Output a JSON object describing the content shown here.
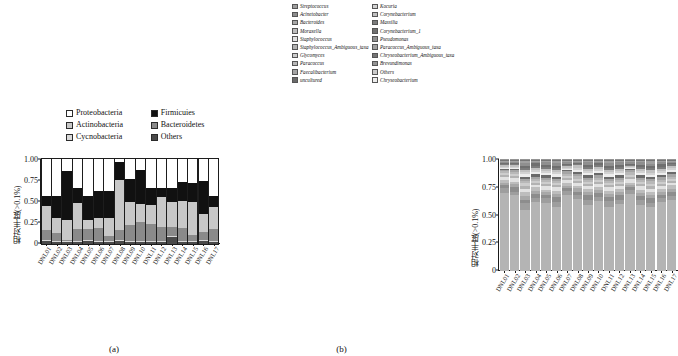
{
  "figure": {
    "panel_a_caption": "(a)",
    "panel_b_caption": "(b)"
  },
  "panel_a": {
    "ylabel": "相对丰度(>0.1%)",
    "legend": [
      {
        "label": "Proteobacteria",
        "color": "#ffffff"
      },
      {
        "label": "Firmicuies",
        "color": "#111111"
      },
      {
        "label": "Actinobacteria",
        "color": "#c8c8c8"
      },
      {
        "label": "Bacteroidetes",
        "color": "#8a8a8a"
      },
      {
        "label": "Cycnobacteria",
        "color": "#d9d9d9"
      },
      {
        "label": "Others",
        "color": "#4a4a4a"
      }
    ]
  },
  "panel_b": {
    "ylabel": "相对丰度(>0.1%)",
    "legend": [
      {
        "label": "Streptococcus",
        "color": "#9e9e9e"
      },
      {
        "label": "Kocuria",
        "color": "#d2d2d2"
      },
      {
        "label": "Acinetobacter",
        "color": "#8d8d8d"
      },
      {
        "label": "Corynebacterium",
        "color": "#c0c0c0"
      },
      {
        "label": "Bacteroides",
        "color": "#a8a8a8"
      },
      {
        "label": "Massilia",
        "color": "#7c7c7c"
      },
      {
        "label": "Moraxella",
        "color": "#bdbdbd"
      },
      {
        "label": "Corynebacterium_1",
        "color": "#6f6f6f"
      },
      {
        "label": "Staphylococcus",
        "color": "#e2e2e2"
      },
      {
        "label": "Pseudomonas",
        "color": "#8f8f8f"
      },
      {
        "label": "Staphylococcus_Ambiguous_taxa",
        "color": "#b2b2b2"
      },
      {
        "label": "Paracoccus_Ambiguous_taxa",
        "color": "#a0a0a0"
      },
      {
        "label": "Glycomyces",
        "color": "#cdcdcd"
      },
      {
        "label": "Chryseobacterium_Ambiguous_taxa",
        "color": "#757575"
      },
      {
        "label": "Paracoccus",
        "color": "#b8b8b8"
      },
      {
        "label": "Brevundimonas",
        "color": "#949494"
      },
      {
        "label": "Faecalibacterium",
        "color": "#a5a5a5"
      },
      {
        "label": "Others",
        "color": "#cacaca"
      },
      {
        "label": "uncultured",
        "color": "#6a6a6a"
      },
      {
        "label": "Chryseobacterium",
        "color": "#ededed"
      }
    ]
  },
  "chart_data": [
    {
      "type": "bar",
      "stacked": true,
      "panel": "(a)",
      "title": "",
      "xlabel": "",
      "ylabel": "相对丰度(>0.1%)",
      "ylim": [
        0,
        1.0
      ],
      "yticks": [
        "0",
        "0.25",
        "0.50",
        "0.75",
        "1.00"
      ],
      "ytick_values": [
        0,
        0.25,
        0.5,
        0.75,
        1.0
      ],
      "grid": false,
      "legend_position": "above-plot",
      "categories": [
        "DNL01",
        "DNL02",
        "DNL03",
        "DNL04",
        "DNL05",
        "DNL06",
        "DNL07",
        "DNL08",
        "DNL09",
        "DNL10",
        "DNL11",
        "DNL12",
        "DNL13",
        "DNL14",
        "DNL15",
        "DNL16",
        "DNL17"
      ],
      "series": [
        {
          "name": "Others",
          "color": "#4a4a4a",
          "values": [
            0.03,
            0.02,
            0.02,
            0.02,
            0.03,
            0.02,
            0.02,
            0.03,
            0.02,
            0.02,
            0.02,
            0.02,
            0.08,
            0.02,
            0.02,
            0.03,
            0.02
          ]
        },
        {
          "name": "Cycnobacteria",
          "color": "#d9d9d9",
          "values": [
            0.02,
            0.02,
            0.01,
            0.02,
            0.02,
            0.02,
            0.02,
            0.02,
            0.02,
            0.02,
            0.02,
            0.02,
            0.02,
            0.02,
            0.02,
            0.02,
            0.02
          ]
        },
        {
          "name": "Bacteroidetes",
          "color": "#8a8a8a",
          "values": [
            0.12,
            0.09,
            0.02,
            0.14,
            0.13,
            0.15,
            0.05,
            0.12,
            0.18,
            0.22,
            0.19,
            0.16,
            0.1,
            0.15,
            0.07,
            0.09,
            0.14
          ]
        },
        {
          "name": "Actinobacteria",
          "color": "#c8c8c8",
          "values": [
            0.28,
            0.18,
            0.23,
            0.3,
            0.1,
            0.12,
            0.22,
            0.58,
            0.28,
            0.21,
            0.23,
            0.35,
            0.3,
            0.32,
            0.39,
            0.21,
            0.25
          ]
        },
        {
          "name": "Firmicuies",
          "color": "#111111",
          "values": [
            0.11,
            0.26,
            0.58,
            0.18,
            0.29,
            0.31,
            0.31,
            0.21,
            0.27,
            0.4,
            0.2,
            0.11,
            0.16,
            0.22,
            0.22,
            0.39,
            0.14
          ]
        },
        {
          "name": "Proteobacteria",
          "color": "#ffffff",
          "values": [
            0.44,
            0.43,
            0.14,
            0.34,
            0.43,
            0.38,
            0.38,
            0.04,
            0.23,
            0.13,
            0.34,
            0.34,
            0.34,
            0.27,
            0.28,
            0.26,
            0.43
          ]
        }
      ]
    },
    {
      "type": "bar",
      "stacked": true,
      "panel": "(b)",
      "title": "",
      "xlabel": "",
      "ylabel": "相对丰度(>0.1%)",
      "ylim": [
        0,
        1.0
      ],
      "yticks": [
        "0",
        "0.25",
        "0.50",
        "0.75",
        "1.00"
      ],
      "ytick_values": [
        0,
        0.25,
        0.5,
        0.75,
        1.0
      ],
      "grid": false,
      "legend_position": "above-plot",
      "note": "Genus-level stacked composition; dominant 'Others' gray base with many thin taxa bands in the upper half of each bar.",
      "categories": [
        "DNL01",
        "DNL02",
        "DNL03",
        "DNL04",
        "DNL05",
        "DNL06",
        "DNL07",
        "DNL08",
        "DNL09",
        "DNL10",
        "DNL11",
        "DNL12",
        "DNL13",
        "DNL14",
        "DNL15",
        "DNL16",
        "DNL17"
      ],
      "series": [
        {
          "name": "Others",
          "color": "#b4b4b4",
          "values": [
            0.72,
            0.7,
            0.55,
            0.63,
            0.62,
            0.58,
            0.68,
            0.66,
            0.6,
            0.64,
            0.58,
            0.61,
            0.69,
            0.6,
            0.57,
            0.63,
            0.65
          ]
        },
        {
          "name": "Streptococcus",
          "color": "#9e9e9e",
          "values": [
            0.04,
            0.03,
            0.06,
            0.03,
            0.04,
            0.05,
            0.03,
            0.04,
            0.05,
            0.03,
            0.06,
            0.04,
            0.03,
            0.05,
            0.04,
            0.04,
            0.03
          ]
        },
        {
          "name": "Acinetobacter",
          "color": "#8d8d8d",
          "values": [
            0.03,
            0.04,
            0.03,
            0.04,
            0.03,
            0.04,
            0.03,
            0.03,
            0.04,
            0.04,
            0.03,
            0.04,
            0.03,
            0.03,
            0.04,
            0.03,
            0.04
          ]
        },
        {
          "name": "Bacteroides",
          "color": "#a8a8a8",
          "values": [
            0.02,
            0.03,
            0.04,
            0.03,
            0.03,
            0.03,
            0.02,
            0.03,
            0.03,
            0.03,
            0.03,
            0.03,
            0.02,
            0.03,
            0.03,
            0.03,
            0.03
          ]
        },
        {
          "name": "Moraxella",
          "color": "#bdbdbd",
          "values": [
            0.03,
            0.02,
            0.03,
            0.03,
            0.02,
            0.03,
            0.03,
            0.02,
            0.03,
            0.02,
            0.03,
            0.03,
            0.02,
            0.03,
            0.03,
            0.02,
            0.03
          ]
        },
        {
          "name": "Staphylococcus",
          "color": "#e2e2e2",
          "values": [
            0.02,
            0.03,
            0.03,
            0.02,
            0.03,
            0.03,
            0.02,
            0.03,
            0.02,
            0.03,
            0.03,
            0.02,
            0.03,
            0.03,
            0.02,
            0.03,
            0.02
          ]
        },
        {
          "name": "Staphylococcus_Ambiguous_taxa",
          "color": "#b2b2b2",
          "values": [
            0.02,
            0.02,
            0.03,
            0.02,
            0.02,
            0.02,
            0.02,
            0.02,
            0.02,
            0.02,
            0.02,
            0.02,
            0.02,
            0.02,
            0.03,
            0.02,
            0.02
          ]
        },
        {
          "name": "Glycomyces",
          "color": "#cdcdcd",
          "values": [
            0.02,
            0.02,
            0.02,
            0.02,
            0.02,
            0.02,
            0.02,
            0.02,
            0.02,
            0.02,
            0.02,
            0.02,
            0.02,
            0.02,
            0.02,
            0.02,
            0.02
          ]
        },
        {
          "name": "Paracoccus",
          "color": "#b8b8b8",
          "values": [
            0.02,
            0.02,
            0.02,
            0.02,
            0.02,
            0.02,
            0.02,
            0.02,
            0.02,
            0.02,
            0.02,
            0.02,
            0.02,
            0.02,
            0.02,
            0.02,
            0.02
          ]
        },
        {
          "name": "Faecalibacterium",
          "color": "#a5a5a5",
          "values": [
            0.01,
            0.02,
            0.02,
            0.02,
            0.02,
            0.02,
            0.02,
            0.02,
            0.02,
            0.02,
            0.02,
            0.02,
            0.02,
            0.02,
            0.02,
            0.02,
            0.02
          ]
        },
        {
          "name": "uncultured",
          "color": "#6a6a6a",
          "values": [
            0.01,
            0.01,
            0.02,
            0.02,
            0.02,
            0.02,
            0.01,
            0.02,
            0.02,
            0.02,
            0.02,
            0.02,
            0.01,
            0.02,
            0.02,
            0.02,
            0.02
          ]
        },
        {
          "name": "Chryseobacterium",
          "color": "#ededed",
          "values": [
            0.01,
            0.01,
            0.02,
            0.02,
            0.02,
            0.02,
            0.01,
            0.02,
            0.02,
            0.02,
            0.02,
            0.02,
            0.01,
            0.02,
            0.02,
            0.02,
            0.02
          ]
        },
        {
          "name": "Kocuria",
          "color": "#d2d2d2",
          "values": [
            0.01,
            0.01,
            0.02,
            0.02,
            0.02,
            0.02,
            0.01,
            0.02,
            0.02,
            0.02,
            0.02,
            0.02,
            0.01,
            0.02,
            0.02,
            0.02,
            0.02
          ]
        },
        {
          "name": "Corynebacterium",
          "color": "#c0c0c0",
          "values": [
            0.01,
            0.01,
            0.02,
            0.02,
            0.02,
            0.02,
            0.02,
            0.02,
            0.02,
            0.02,
            0.02,
            0.02,
            0.01,
            0.02,
            0.02,
            0.02,
            0.02
          ]
        },
        {
          "name": "Massilia",
          "color": "#7c7c7c",
          "values": [
            0.01,
            0.01,
            0.02,
            0.02,
            0.02,
            0.02,
            0.01,
            0.01,
            0.02,
            0.02,
            0.02,
            0.02,
            0.01,
            0.02,
            0.02,
            0.02,
            0.01
          ]
        },
        {
          "name": "Corynebacterium_1",
          "color": "#6f6f6f",
          "values": [
            0.01,
            0.01,
            0.02,
            0.02,
            0.02,
            0.02,
            0.01,
            0.01,
            0.02,
            0.01,
            0.02,
            0.02,
            0.01,
            0.02,
            0.02,
            0.02,
            0.01
          ]
        },
        {
          "name": "Pseudomonas",
          "color": "#8f8f8f",
          "values": [
            0.01,
            0.01,
            0.02,
            0.01,
            0.02,
            0.02,
            0.01,
            0.01,
            0.02,
            0.01,
            0.02,
            0.02,
            0.01,
            0.02,
            0.02,
            0.02,
            0.01
          ]
        },
        {
          "name": "Paracoccus_Ambiguous_taxa",
          "color": "#a0a0a0",
          "values": [
            0.01,
            0.01,
            0.02,
            0.01,
            0.01,
            0.02,
            0.01,
            0.01,
            0.01,
            0.01,
            0.02,
            0.01,
            0.01,
            0.01,
            0.02,
            0.01,
            0.01
          ]
        },
        {
          "name": "Chryseobacterium_Ambiguous_taxa",
          "color": "#757575",
          "values": [
            0.01,
            0.01,
            0.01,
            0.01,
            0.01,
            0.01,
            0.01,
            0.01,
            0.01,
            0.01,
            0.01,
            0.01,
            0.01,
            0.01,
            0.01,
            0.01,
            0.01
          ]
        },
        {
          "name": "Brevundimonas",
          "color": "#949494",
          "values": [
            0.01,
            0.01,
            0.01,
            0.01,
            0.01,
            0.01,
            0.01,
            0.01,
            0.01,
            0.01,
            0.01,
            0.01,
            0.01,
            0.01,
            0.01,
            0.01,
            0.01
          ]
        }
      ]
    }
  ]
}
